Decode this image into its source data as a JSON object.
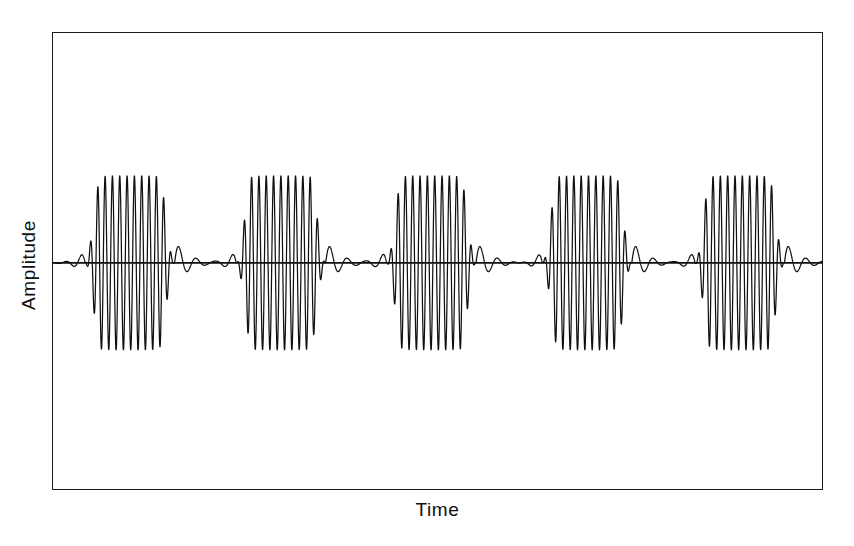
{
  "figure": {
    "background_color": "#ffffff",
    "frame_color": "#1a1a1a",
    "trace_color": "#111111"
  },
  "axes": {
    "x_title": "Time",
    "y_title": "Amplitude"
  },
  "chart_data": {
    "type": "line",
    "title": "",
    "subtitle": "",
    "xlabel": "Time",
    "ylabel": "Amplitude",
    "legend": [],
    "legend_position": "none",
    "grid": false,
    "tick_labels_x": [],
    "tick_labels_y": [],
    "xlim": [
      0,
      100
    ],
    "ylim": [
      -1.15,
      1.15
    ],
    "baseline_value": 0,
    "baseline_y_fraction_from_top": 0.504,
    "signal": {
      "waveform_kind": "pulsed-carrier-burst-train",
      "burst_count": 5,
      "carrier_cycles_per_burst": 14,
      "carrier_period_x_units": 0.95,
      "burst_period_x_units": 19.6,
      "burst_plateau_width_x_units": 11.7,
      "burst_rise_width_x_units": 2.1,
      "burst_fall_width_x_units": 2.1,
      "peak_amplitude": 1.0,
      "ring_peak_amplitude": 0.25,
      "ring_decay": 0.55
    },
    "bursts": [
      {
        "index": 1,
        "center_x": 10.1,
        "start_x": 4.3,
        "end_x": 15.9,
        "peak_amplitude": 1.0
      },
      {
        "index": 2,
        "center_x": 29.7,
        "start_x": 23.9,
        "end_x": 35.5,
        "peak_amplitude": 1.0
      },
      {
        "index": 3,
        "center_x": 49.2,
        "start_x": 43.4,
        "end_x": 55.0,
        "peak_amplitude": 1.0
      },
      {
        "index": 4,
        "center_x": 69.4,
        "start_x": 63.6,
        "end_x": 75.2,
        "peak_amplitude": 1.0
      },
      {
        "index": 5,
        "center_x": 89.2,
        "start_x": 83.4,
        "end_x": 95.0,
        "peak_amplitude": 1.0
      }
    ],
    "series": [
      {
        "name": "burst-train",
        "color": "#111111",
        "note": "Dense carrier oscillation; point data generated from the burst envelope parameters above."
      }
    ]
  }
}
